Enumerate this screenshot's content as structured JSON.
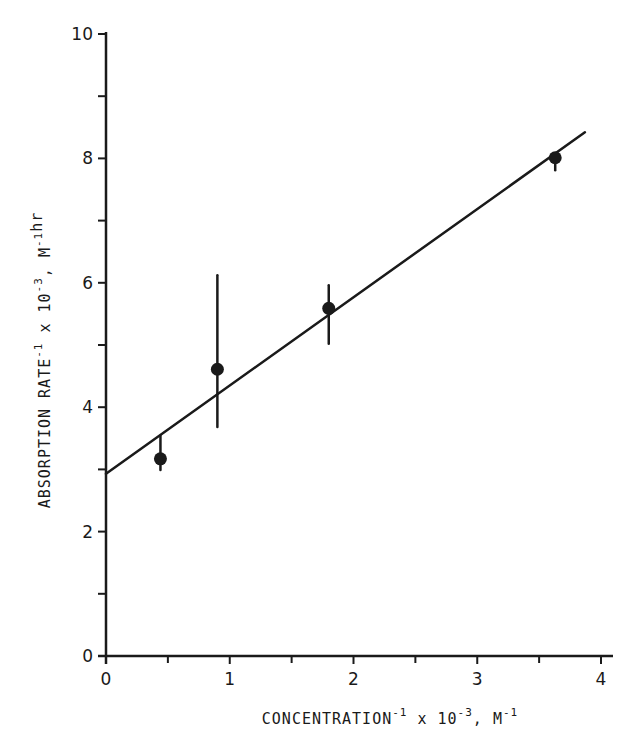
{
  "chart_data": {
    "type": "scatter",
    "title": "",
    "xlabel": "CONCENTRATION⁻¹ x 10⁻³, M⁻¹",
    "ylabel": "ABSORPTION RATE⁻¹ x 10⁻³, M⁻¹hr",
    "xlabel_parts": {
      "main": "CONCENTRATION",
      "sup1": "-1",
      "mid": " x 10",
      "sup2": "-3",
      "unit": ", M",
      "sup3": "-1"
    },
    "ylabel_parts": {
      "main": "ABSORPTION RATE",
      "sup1": "-1",
      "mid": " x 10",
      "sup2": "-3",
      "unit": ", M",
      "sup3": "-1",
      "tail": "hr"
    },
    "xlim": [
      0,
      4
    ],
    "ylim": [
      0,
      10
    ],
    "x_ticks": [
      0,
      1,
      2,
      3,
      4
    ],
    "x_tick_labels": [
      "0",
      "1",
      "2",
      "3",
      "4"
    ],
    "x_minor_ticks": [
      0.5,
      1.5,
      2.5,
      3.5
    ],
    "y_ticks": [
      0,
      2,
      4,
      6,
      8,
      10
    ],
    "y_tick_labels": [
      "0",
      "2",
      "4",
      "6",
      "8",
      "10"
    ],
    "y_minor_ticks": [
      1,
      3,
      5,
      7,
      9
    ],
    "grid": false,
    "legend": null,
    "series": [
      {
        "name": "measured",
        "kind": "points_with_error_bars",
        "points": [
          {
            "x": 0.44,
            "y": 3.17,
            "err_low": 2.99,
            "err_high": 3.54
          },
          {
            "x": 0.9,
            "y": 4.61,
            "err_low": 3.68,
            "err_high": 6.12
          },
          {
            "x": 1.8,
            "y": 5.59,
            "err_low": 5.02,
            "err_high": 5.96
          },
          {
            "x": 3.63,
            "y": 8.01,
            "err_low": 7.81,
            "err_high": 8.01
          }
        ]
      },
      {
        "name": "linear fit",
        "kind": "line",
        "x": [
          0,
          3.87
        ],
        "y": [
          2.93,
          8.42
        ]
      }
    ]
  },
  "colors": {
    "ink": "#1a1a1a",
    "background": "#ffffff"
  }
}
